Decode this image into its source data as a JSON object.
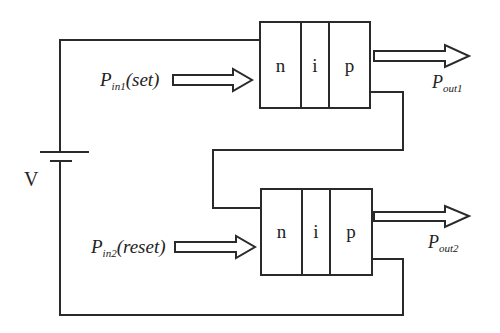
{
  "diagram": {
    "type": "circuit",
    "source": {
      "label": "V"
    },
    "device_top": {
      "layers": [
        "n",
        "i",
        "p"
      ],
      "input": {
        "symbol": "P",
        "subscript": "in1",
        "suffix": "(set)"
      },
      "output": {
        "symbol": "P",
        "subscript": "out1"
      }
    },
    "device_bottom": {
      "layers": [
        "n",
        "i",
        "p"
      ],
      "input": {
        "symbol": "P",
        "subscript": "in2",
        "suffix": "(reset)"
      },
      "output": {
        "symbol": "P",
        "subscript": "out2"
      }
    },
    "colors": {
      "line": "#2a2a2a",
      "background": "#ffffff"
    }
  }
}
